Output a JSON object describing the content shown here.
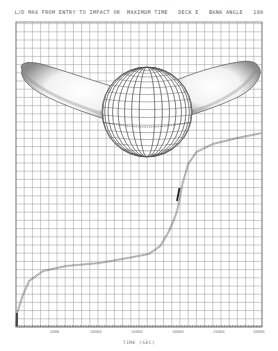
{
  "header": {
    "title": "L/D MAX FROM ENTRY TO IMPACT OR  MAXIMUM TIME   DECK E   BANK ANGLE   180"
  },
  "colors": {
    "background": "#ffffff",
    "grid": "#9a9a9a",
    "ink": "#4a4a4a",
    "wing_shade": "#7a7a7a"
  },
  "chart_data": {
    "type": "line",
    "title": "L/D MAX FROM ENTRY TO IMPACT OR MAXIMUM TIME   DECK E   BANK ANGLE 180",
    "xlabel": "TIME (SEC)",
    "ylabel": "",
    "xlim": [
      0,
      30000
    ],
    "x_ticks": [
      0,
      5000,
      10000,
      15000,
      20000,
      25000,
      30000
    ],
    "x_tick_labels": [
      "0",
      "5000",
      "10000",
      "15000",
      "20000",
      "25000",
      "30000"
    ],
    "grid": true,
    "legend": null,
    "series": [
      {
        "name": "trajectory",
        "style": "dotted-markers",
        "x": [
          0,
          100,
          800,
          1600,
          3300,
          6100,
          10200,
          14300,
          16200,
          17600,
          18600,
          19200,
          19600,
          19900,
          20300,
          21000,
          22000,
          24000,
          27000,
          30000
        ],
        "y_pixel_from_bottom": [
          0,
          12,
          30,
          45,
          55,
          60,
          63,
          69,
          72,
          80,
          94,
          105,
          114,
          124,
          142,
          162,
          174,
          182,
          188,
          193
        ]
      }
    ],
    "annotations": [
      "wireframe globe with two shaded wing-shaped lobes (upper area)"
    ]
  },
  "xaxis": {
    "label": "TIME  (SEC)",
    "tick_labels": [
      "5000",
      "10000",
      "15000",
      "20000",
      "25000",
      "30000"
    ]
  }
}
